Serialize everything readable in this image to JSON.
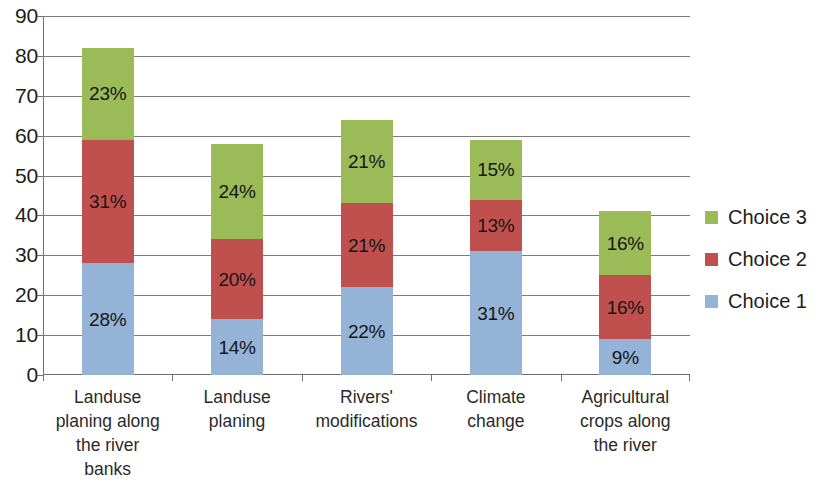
{
  "chart_data": {
    "type": "bar",
    "subtype": "stacked-bar",
    "title": "",
    "xlabel": "",
    "ylabel": "",
    "ylim": [
      0,
      90
    ],
    "y_ticks": [
      0,
      10,
      20,
      30,
      40,
      50,
      60,
      70,
      80,
      90
    ],
    "y_tick_labels": [
      "0",
      "10",
      "20",
      "30",
      "40",
      "50",
      "60",
      "70",
      "80",
      "90"
    ],
    "grid": true,
    "legend_position": "right",
    "categories": [
      "Landuse planing along the river banks",
      "Landuse planing",
      "Rivers' modifications",
      "Climate change",
      "Agricultural crops along the river"
    ],
    "category_label_lines": [
      [
        "Landuse",
        "planing along",
        "the river",
        "banks"
      ],
      [
        "Landuse",
        "planing"
      ],
      [
        "Rivers'",
        "modifications"
      ],
      [
        "Climate",
        "change"
      ],
      [
        "Agricultural",
        "crops along",
        "the river"
      ]
    ],
    "series": [
      {
        "name": "Choice 1",
        "color": "#95B3D7",
        "values": [
          28,
          14,
          22,
          31,
          9
        ],
        "labels": [
          "28%",
          "14%",
          "22%",
          "31%",
          "9%"
        ]
      },
      {
        "name": "Choice 2",
        "color": "#C0504D",
        "values": [
          31,
          20,
          21,
          13,
          16
        ],
        "labels": [
          "31%",
          "20%",
          "21%",
          "13%",
          "16%"
        ]
      },
      {
        "name": "Choice 3",
        "color": "#9BBB59",
        "values": [
          23,
          24,
          21,
          15,
          16
        ],
        "labels": [
          "23%",
          "24%",
          "21%",
          "15%",
          "16%"
        ]
      }
    ],
    "totals": [
      82,
      58,
      64,
      59,
      41
    ]
  },
  "legend": {
    "items": [
      {
        "label": "Choice 3",
        "color": "#9BBB59"
      },
      {
        "label": "Choice 2",
        "color": "#C0504D"
      },
      {
        "label": "Choice 1",
        "color": "#95B3D7"
      }
    ]
  }
}
